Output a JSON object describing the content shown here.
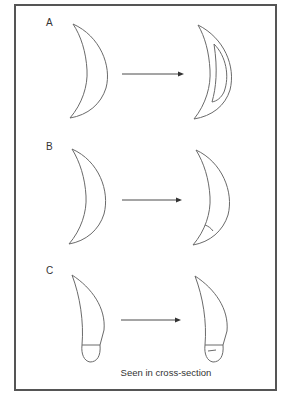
{
  "figure": {
    "frame_color": "#555555",
    "stroke_color": "#6a6a6a",
    "panels": [
      {
        "id": "A",
        "label": "A",
        "before": "crescent",
        "after": "crescent with internal cavity",
        "arrow": "transforms into"
      },
      {
        "id": "B",
        "label": "B",
        "before": "crescent",
        "after": "crescent with small tick mark near lower tip",
        "arrow": "transforms into"
      },
      {
        "id": "C",
        "label": "C",
        "before": "tooth-shaped form with base line",
        "after": "tooth-shaped form with base line and inner mark",
        "arrow": "transforms into"
      }
    ],
    "caption": "Seen in cross-section"
  }
}
